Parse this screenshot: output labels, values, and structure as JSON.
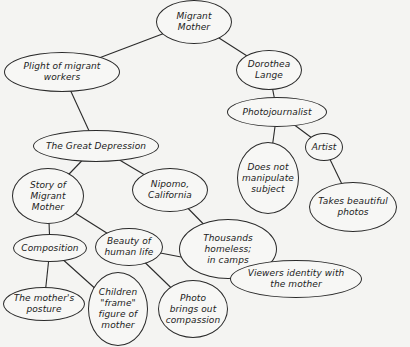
{
  "diagram": {
    "type": "concept-map",
    "nodes": [
      {
        "id": "migrant_mother",
        "label": "Migrant\nMother",
        "cx": 194,
        "cy": 22,
        "rx": 38,
        "ry": 22
      },
      {
        "id": "plight",
        "label": "Plight of migrant\nworkers",
        "cx": 62,
        "cy": 72,
        "rx": 58,
        "ry": 20
      },
      {
        "id": "dorothea",
        "label": "Dorothea\nLange",
        "cx": 269,
        "cy": 70,
        "rx": 33,
        "ry": 20
      },
      {
        "id": "photojournalist",
        "label": "Photojournalist",
        "cx": 277,
        "cy": 112,
        "rx": 50,
        "ry": 15
      },
      {
        "id": "great_depression",
        "label": "The Great Depression",
        "cx": 96,
        "cy": 146,
        "rx": 63,
        "ry": 16
      },
      {
        "id": "story",
        "label": "Story of\nMigrant\nMother",
        "cx": 48,
        "cy": 196,
        "rx": 36,
        "ry": 28
      },
      {
        "id": "nipomo",
        "label": "Nipomo,\nCalifornia",
        "cx": 170,
        "cy": 190,
        "rx": 38,
        "ry": 22
      },
      {
        "id": "not_manipulate",
        "label": "Does not\nmanipulate\nsubject",
        "cx": 268,
        "cy": 178,
        "rx": 31,
        "ry": 36
      },
      {
        "id": "artist",
        "label": "Artist",
        "cx": 324,
        "cy": 147,
        "rx": 19,
        "ry": 14
      },
      {
        "id": "beautiful_photos",
        "label": "Takes beautiful\nphotos",
        "cx": 353,
        "cy": 207,
        "rx": 44,
        "ry": 25
      },
      {
        "id": "thousands",
        "label": "Thousands\nhomeless;\nin camps",
        "cx": 228,
        "cy": 249,
        "rx": 49,
        "ry": 30
      },
      {
        "id": "composition",
        "label": "Composition",
        "cx": 50,
        "cy": 248,
        "rx": 37,
        "ry": 14
      },
      {
        "id": "beauty",
        "label": "Beauty of\nhuman life",
        "cx": 129,
        "cy": 247,
        "rx": 34,
        "ry": 19
      },
      {
        "id": "viewers",
        "label": "Viewers identity with\nthe mother",
        "cx": 296,
        "cy": 279,
        "rx": 66,
        "ry": 19
      },
      {
        "id": "compassion",
        "label": "Photo\nbrings out\ncompassion",
        "cx": 193,
        "cy": 309,
        "rx": 35,
        "ry": 29
      },
      {
        "id": "posture",
        "label": "The mother's\nposture",
        "cx": 44,
        "cy": 304,
        "rx": 41,
        "ry": 17
      },
      {
        "id": "children",
        "label": "Children\n\"frame\"\nfigure of\nmother",
        "cx": 118,
        "cy": 309,
        "rx": 30,
        "ry": 37
      }
    ],
    "edges": [
      [
        "migrant_mother",
        "plight"
      ],
      [
        "migrant_mother",
        "dorothea"
      ],
      [
        "dorothea",
        "photojournalist"
      ],
      [
        "plight",
        "great_depression"
      ],
      [
        "photojournalist",
        "not_manipulate"
      ],
      [
        "photojournalist",
        "artist"
      ],
      [
        "artist",
        "beautiful_photos"
      ],
      [
        "great_depression",
        "story"
      ],
      [
        "great_depression",
        "nipomo"
      ],
      [
        "nipomo",
        "thousands"
      ],
      [
        "story",
        "composition"
      ],
      [
        "story",
        "beauty"
      ],
      [
        "composition",
        "posture"
      ],
      [
        "composition",
        "children"
      ],
      [
        "beauty",
        "compassion"
      ],
      [
        "beauty",
        "viewers"
      ]
    ],
    "colors": {
      "line": "#2a2a2a",
      "background": "#f4f4f2",
      "text": "#222222"
    }
  }
}
